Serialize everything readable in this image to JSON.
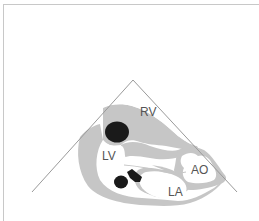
{
  "diagram": {
    "type": "echocardiography-view-schematic",
    "sector": {
      "apex": [
        133,
        80
      ],
      "left_end": [
        32,
        192
      ],
      "right_end": [
        237,
        192
      ]
    },
    "labels": {
      "rv": "RV",
      "lv": "LV",
      "ao": "AO",
      "la": "LA"
    },
    "colors": {
      "tissue": "#c6c6c6",
      "chamber": "#ffffff",
      "solid": "#1a1a1a",
      "line": "#9a9a9a",
      "frame": "#c8c8c8",
      "text": "#555555"
    }
  }
}
